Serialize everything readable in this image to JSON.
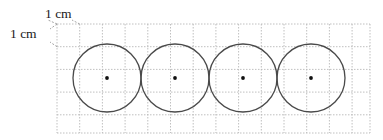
{
  "figure": {
    "background_color": "#ffffff",
    "width": 383,
    "height": 140
  },
  "labels": {
    "horizontal": {
      "text": "1 cm",
      "x": 45,
      "y": 18,
      "meaning": "width of one grid square"
    },
    "vertical": {
      "text": "1 cm",
      "x": 10,
      "y": 38,
      "meaning": "height of one grid square"
    }
  },
  "grid": {
    "line_color": "#b9b9b9",
    "dash": "1.5 1.5",
    "stroke_width": 0.9,
    "cell_size_px": 22.7,
    "cell_size_label": "1 cm",
    "left": 57,
    "top": 24,
    "right": 370,
    "bottom": 133,
    "columns": 14,
    "rows": 5
  },
  "circles": {
    "count": 4,
    "stroke_color": "#4a4a4a",
    "stroke_width": 1.3,
    "fill": "none",
    "radius_px": 34,
    "radius_label": "1.5 cm",
    "diameter_label": "3 cm",
    "center_y": 78,
    "centers_x": [
      107,
      175,
      243,
      311
    ],
    "arrangement": "tangent, left to right",
    "center_dot": {
      "color": "#111111",
      "radius_px": 1.9
    }
  },
  "leaders": {
    "color": "#9a9a9a",
    "dash": "2 1.6",
    "stroke_width": 0.9,
    "horizontal_left": {
      "x1": 57,
      "y1": 24,
      "x2": 48,
      "y2": 20
    },
    "horizontal_right": {
      "x1": 79.7,
      "y1": 24,
      "x2": 72,
      "y2": 20
    },
    "vertical_top": {
      "x1": 57,
      "y1": 24,
      "x2": 50,
      "y2": 29
    },
    "vertical_bottom": {
      "x1": 57,
      "y1": 46.7,
      "x2": 50,
      "y2": 42
    }
  }
}
